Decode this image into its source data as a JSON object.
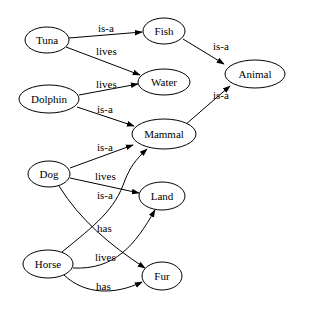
{
  "diagram": {
    "type": "directed-graph",
    "nodes": [
      {
        "id": "tuna",
        "label": "Tuna",
        "cx": 47,
        "cy": 40,
        "rx": 22,
        "ry": 13
      },
      {
        "id": "fish",
        "label": "Fish",
        "cx": 164,
        "cy": 31,
        "rx": 21,
        "ry": 13
      },
      {
        "id": "water",
        "label": "Water",
        "cx": 164,
        "cy": 82,
        "rx": 26,
        "ry": 13
      },
      {
        "id": "animal",
        "label": "Animal",
        "cx": 245,
        "cy": 74,
        "rx": 30,
        "ry": 14
      },
      {
        "id": "dolphin",
        "label": "Dolphin",
        "cx": 49,
        "cy": 99,
        "rx": 30,
        "ry": 14
      },
      {
        "id": "mammal",
        "label": "Mammal",
        "cx": 157,
        "cy": 134,
        "rx": 34,
        "ry": 15
      },
      {
        "id": "dog",
        "label": "Dog",
        "cx": 49,
        "cy": 174,
        "rx": 21,
        "ry": 13
      },
      {
        "id": "land",
        "label": "Land",
        "cx": 162,
        "cy": 196,
        "rx": 23,
        "ry": 14
      },
      {
        "id": "horse",
        "label": "Horse",
        "cx": 48,
        "cy": 264,
        "rx": 25,
        "ry": 14
      },
      {
        "id": "fur",
        "label": "Fur",
        "cx": 162,
        "cy": 276,
        "rx": 20,
        "ry": 14
      }
    ],
    "edges": [
      {
        "from": "tuna",
        "to": "fish",
        "label": "is-a"
      },
      {
        "from": "tuna",
        "to": "water",
        "label": "lives"
      },
      {
        "from": "dolphin",
        "to": "water",
        "label": "lives"
      },
      {
        "from": "dolphin",
        "to": "mammal",
        "label": "is-a"
      },
      {
        "from": "fish",
        "to": "animal",
        "label": "is-a"
      },
      {
        "from": "mammal",
        "to": "animal",
        "label": "is-a"
      },
      {
        "from": "dog",
        "to": "mammal",
        "label": "is-a"
      },
      {
        "from": "dog",
        "to": "land",
        "label": "lives"
      },
      {
        "from": "dog",
        "to": "fur",
        "label": "has"
      },
      {
        "from": "horse",
        "to": "mammal",
        "label": "is-a"
      },
      {
        "from": "horse",
        "to": "land",
        "label": "lives"
      },
      {
        "from": "horse",
        "to": "fur",
        "label": "has"
      }
    ]
  },
  "labels": {
    "nodes": {
      "tuna": "Tuna",
      "fish": "Fish",
      "water": "Water",
      "animal": "Animal",
      "dolphin": "Dolphin",
      "mammal": "Mammal",
      "dog": "Dog",
      "land": "Land",
      "horse": "Horse",
      "fur": "Fur"
    },
    "edges": {
      "tuna_fish": "is-a",
      "tuna_water": "lives",
      "dolphin_water": "lives",
      "dolphin_mammal": "is-a",
      "fish_animal": "is-a",
      "mammal_animal": "is-a",
      "dog_mammal": "is-a",
      "dog_land": "lives",
      "dog_fur": "has",
      "horse_mammal": "is-a",
      "horse_land": "lives",
      "horse_fur": "has"
    }
  }
}
